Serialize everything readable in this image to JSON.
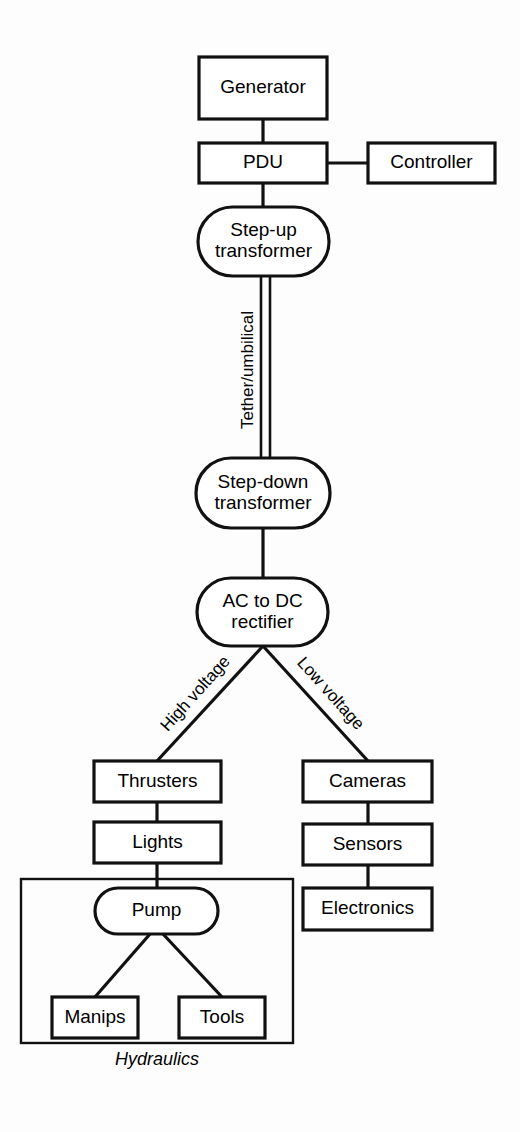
{
  "diagram": {
    "background_color": "#fdfdfd",
    "stroke_color": "#111111",
    "fill_color": "#ffffff",
    "nodes": [
      {
        "id": "generator",
        "label": "Generator",
        "shape": "rect",
        "x": 199,
        "y": 57,
        "w": 128,
        "h": 62
      },
      {
        "id": "pdu",
        "label": "PDU",
        "shape": "rect",
        "x": 199,
        "y": 143,
        "w": 128,
        "h": 40
      },
      {
        "id": "controller",
        "label": "Controller",
        "shape": "rect",
        "x": 368,
        "y": 143,
        "w": 127,
        "h": 40
      },
      {
        "id": "stepup",
        "label": "Step-up\ntransformer",
        "shape": "stadium",
        "x": 198,
        "y": 207,
        "w": 131,
        "h": 69
      },
      {
        "id": "stepdown",
        "label": "Step-down\ntransformer",
        "shape": "stadium",
        "x": 196,
        "y": 458,
        "w": 134,
        "h": 70
      },
      {
        "id": "rectifier",
        "label": "AC to DC\nrectifier",
        "shape": "stadium",
        "x": 197,
        "y": 578,
        "w": 131,
        "h": 68
      },
      {
        "id": "thrusters",
        "label": "Thrusters",
        "shape": "rect",
        "x": 94,
        "y": 761,
        "w": 127,
        "h": 41
      },
      {
        "id": "lights",
        "label": "Lights",
        "shape": "rect",
        "x": 94,
        "y": 822,
        "w": 127,
        "h": 41
      },
      {
        "id": "cameras",
        "label": "Cameras",
        "shape": "rect",
        "x": 303,
        "y": 761,
        "w": 129,
        "h": 41
      },
      {
        "id": "sensors",
        "label": "Sensors",
        "shape": "rect",
        "x": 303,
        "y": 824,
        "w": 129,
        "h": 41
      },
      {
        "id": "electronics",
        "label": "Electronics",
        "shape": "rect",
        "x": 303,
        "y": 888,
        "w": 129,
        "h": 42
      },
      {
        "id": "pump",
        "label": "Pump",
        "shape": "stadium",
        "x": 95,
        "y": 888,
        "w": 123,
        "h": 46
      },
      {
        "id": "manips",
        "label": "Manips",
        "shape": "rect",
        "x": 52,
        "y": 997,
        "w": 86,
        "h": 41
      },
      {
        "id": "tools",
        "label": "Tools",
        "shape": "rect",
        "x": 179,
        "y": 997,
        "w": 86,
        "h": 41
      }
    ],
    "groups": [
      {
        "id": "hydraulics",
        "label": "Hydraulics",
        "x": 21,
        "y": 879,
        "w": 272,
        "h": 164,
        "label_x": 157,
        "label_y": 1060
      }
    ],
    "links": [
      {
        "id": "generator-pdu",
        "from": "Generator",
        "to": "PDU",
        "points": "263,119 263,143"
      },
      {
        "id": "pdu-controller",
        "from": "PDU",
        "to": "Controller",
        "points": "327,163 368,163"
      },
      {
        "id": "pdu-stepup",
        "from": "PDU",
        "to": "Step-up transformer",
        "points": "263,183 263,207"
      },
      {
        "id": "stepdown-rect",
        "from": "Step-down transformer",
        "to": "AC to DC rectifier",
        "points": "263,528 263,578"
      },
      {
        "id": "rect-thrusters",
        "from": "AC to DC rectifier",
        "to": "Thrusters",
        "points": "263,646 157,761"
      },
      {
        "id": "rect-cameras",
        "from": "AC to DC rectifier",
        "to": "Cameras",
        "points": "263,646 368,761"
      },
      {
        "id": "thrusters-lights",
        "from": "Thrusters",
        "to": "Lights",
        "points": "157,802 157,822"
      },
      {
        "id": "lights-pump",
        "from": "Lights",
        "to": "Pump",
        "points": "157,863 157,888"
      },
      {
        "id": "cameras-sensors",
        "from": "Cameras",
        "to": "Sensors",
        "points": "368,802 368,824"
      },
      {
        "id": "sensors-electronics",
        "from": "Sensors",
        "to": "Electronics",
        "points": "368,865 368,888"
      },
      {
        "id": "pump-manips",
        "from": "Pump",
        "to": "Manips",
        "points": "150,934 95,997"
      },
      {
        "id": "pump-tools",
        "from": "Pump",
        "to": "Tools",
        "points": "163,934 222,997"
      }
    ],
    "tether": {
      "id": "tether",
      "label": "Tether/umbilical",
      "line_left_x": 261,
      "line_right_x": 270,
      "y_top": 276,
      "y_bottom": 458,
      "label_x": 249,
      "label_y": 370,
      "label_rotation": -90
    },
    "edge_labels": [
      {
        "id": "high-voltage",
        "text": "High voltage",
        "x": 196,
        "y": 694,
        "rotation": -48
      },
      {
        "id": "low-voltage",
        "text": "Low voltage",
        "x": 330,
        "y": 694,
        "rotation": 48
      }
    ]
  }
}
